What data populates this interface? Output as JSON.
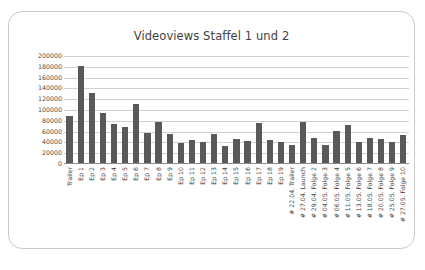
{
  "chart_data": {
    "type": "bar",
    "title": "Videoviews Staffel 1 und 2",
    "xlabel": "",
    "ylabel": "",
    "ylim": [
      0,
      200000
    ],
    "ytick_step": 20000,
    "yticks": [
      200000,
      180000,
      160000,
      140000,
      120000,
      100000,
      80000,
      60000,
      40000,
      20000,
      0
    ],
    "ytick_labels": [
      "200000",
      "180000",
      "160000",
      "140000",
      "120000",
      "100000",
      "80000",
      "60000",
      "40000",
      "20000",
      "0"
    ],
    "grid": true,
    "legend": false,
    "bar_color": "#595959",
    "categories": [
      "Trailer",
      "Ep 1",
      "Ep 2",
      "Ep 3",
      "Ep 4",
      "Ep 5",
      "Ep 6",
      "Ep 7",
      "Ep 8",
      "Ep 9",
      "Ep 10",
      "Ep 11",
      "Ep 12",
      "Ep 13",
      "Ep 14",
      "Ep 15",
      "Ep 16",
      "Ep 17",
      "Ep 18",
      "Ep 19",
      "# 22.04. Trailer",
      "# 27.04. Launch",
      "# 29.04. Folge 2",
      "# 04.05. Folge 3",
      "# 06.05. Folge 4",
      "# 11.05. Folge 5",
      "# 13.05. Folge 6",
      "# 18.05. Folge 7",
      "# 20.05. Folge 8",
      "# 25.05. Folge 9",
      "# 27.05. Folge 10"
    ],
    "values": [
      88000,
      182000,
      131000,
      95000,
      75000,
      68000,
      112000,
      58000,
      77000,
      55000,
      38000,
      45000,
      41000,
      56000,
      33000,
      46000,
      42000,
      76000,
      44000,
      40000,
      36000,
      77000,
      49000,
      35000,
      62000,
      72000,
      40000,
      49000,
      47000,
      41000,
      54000
    ]
  }
}
